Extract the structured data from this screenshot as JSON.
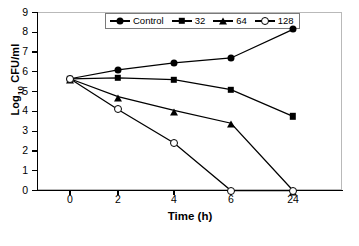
{
  "chart_data": {
    "type": "line",
    "title": "",
    "xlabel": "Time (h)",
    "ylabel": "Log10 CFU/ml",
    "ylabel_base": "Log",
    "ylabel_sub": "10",
    "ylabel_rest": " CFU/ml",
    "categories": [
      "0",
      "2",
      "4",
      "6",
      "24"
    ],
    "x_tick_labels": [
      "0",
      "2",
      "4",
      "6",
      "24"
    ],
    "y_tick_labels": [
      "0",
      "1",
      "2",
      "3",
      "4",
      "5",
      "6",
      "7",
      "8",
      "9"
    ],
    "ylim": [
      0,
      9
    ],
    "grid": false,
    "legend_position": "top-center",
    "series": [
      {
        "name": "Control",
        "marker": "filled-circle",
        "color": "#000000",
        "values": [
          5.65,
          6.1,
          6.45,
          6.7,
          8.15
        ]
      },
      {
        "name": "32",
        "marker": "filled-square",
        "color": "#000000",
        "values": [
          5.65,
          5.7,
          5.6,
          5.1,
          3.75
        ]
      },
      {
        "name": "64",
        "marker": "filled-triangle",
        "color": "#000000",
        "values": [
          5.65,
          4.75,
          4.05,
          3.4,
          0
        ]
      },
      {
        "name": "128",
        "marker": "open-circle",
        "color": "#000000",
        "values": [
          5.65,
          4.1,
          2.4,
          0,
          0
        ]
      }
    ]
  }
}
